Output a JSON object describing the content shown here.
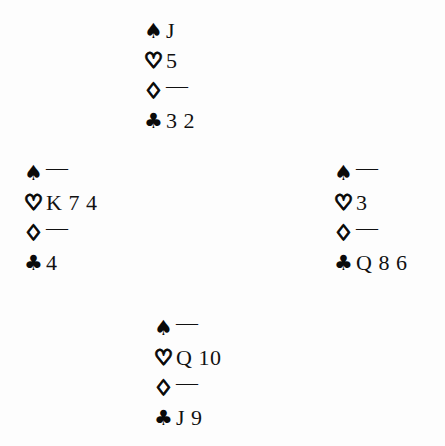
{
  "diagram": {
    "type": "bridge-deal",
    "void_marker": "—",
    "colors": {
      "ink": "#0a0a0a",
      "page": "#fdfdfd"
    },
    "suit_symbols": {
      "spade": "♠",
      "heart": "♡",
      "diamond": "♢",
      "club": "♣"
    },
    "hands": {
      "north": {
        "spades": "J",
        "hearts": "5",
        "diamonds": "—",
        "clubs": "3 2"
      },
      "west": {
        "spades": "—",
        "hearts": "K 7 4",
        "diamonds": "—",
        "clubs": "4"
      },
      "east": {
        "spades": "—",
        "hearts": "3",
        "diamonds": "—",
        "clubs": "Q 8 6"
      },
      "south": {
        "spades": "—",
        "hearts": "Q 10",
        "diamonds": "—",
        "clubs": "J 9"
      }
    }
  }
}
